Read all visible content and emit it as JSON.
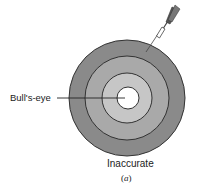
{
  "figure": {
    "labels": {
      "bullseye": "Bull's-eye",
      "caption": "Inaccurate",
      "sub_open": "(",
      "sub_letter": "a",
      "sub_close": ")"
    },
    "target": {
      "center": [
        127,
        98
      ],
      "rings": [
        {
          "name": "outer-ring",
          "radius": 58,
          "fill": "#8a8a8a"
        },
        {
          "name": "middle-ring",
          "radius": 42,
          "fill": "#a9a9a9"
        },
        {
          "name": "inner-ring",
          "radius": 25,
          "fill": "#c6c6c6"
        },
        {
          "name": "bullseye",
          "radius": 11,
          "fill": "#ffffff"
        }
      ],
      "stroke": "#333333"
    },
    "dart": {
      "tip": [
        146,
        52
      ],
      "tail": [
        176,
        6
      ]
    }
  }
}
